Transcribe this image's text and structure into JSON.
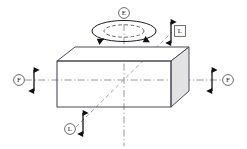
{
  "diagram": {
    "shape": "rectangular-box",
    "colors": {
      "outline": "#3c3c4a",
      "face_shade": "#e2e2e2",
      "top_face": "#ffffff",
      "front_face": "#ffffff",
      "centerline": "#8a8a8a",
      "arrow": "#111111",
      "label_text": "#1a1a1a",
      "label_border": "#5a5a5a",
      "background": "#ffffff"
    },
    "labels": [
      {
        "id": "label-top",
        "text": "E",
        "marker": "circle",
        "x": 124,
        "y": 13
      },
      {
        "id": "label-upper-right",
        "text": "L",
        "marker": "square",
        "x": 180,
        "y": 31
      },
      {
        "id": "label-left",
        "text": "F",
        "marker": "circle",
        "x": 19,
        "y": 80
      },
      {
        "id": "label-right",
        "text": "F",
        "marker": "circle",
        "x": 228,
        "y": 80
      },
      {
        "id": "label-bottom-left",
        "text": "L",
        "marker": "circle",
        "x": 70,
        "y": 129
      }
    ],
    "axes": [
      {
        "id": "horizontal-axis",
        "style": "dash-dot",
        "orientation": "horizontal"
      },
      {
        "id": "vertical-axis",
        "style": "dash-dot",
        "orientation": "vertical"
      },
      {
        "id": "diagonal-axis",
        "style": "dashed",
        "orientation": "diagonal"
      }
    ],
    "arrows": [
      {
        "id": "arrow-left",
        "type": "double-headed",
        "orientation": "vertical"
      },
      {
        "id": "arrow-right",
        "type": "double-headed",
        "orientation": "vertical"
      },
      {
        "id": "arrow-top-right",
        "type": "double-headed",
        "orientation": "vertical"
      },
      {
        "id": "arrow-bottom-left",
        "type": "double-headed",
        "orientation": "vertical"
      }
    ],
    "rotation": {
      "id": "rotation-indicator",
      "style": "concentric-dashed-ellipses",
      "arrowheads": 2,
      "direction": "clockwise-about-vertical-axis"
    }
  }
}
